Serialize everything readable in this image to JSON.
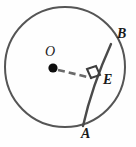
{
  "figure": {
    "background_color": "#fefefe",
    "stroke_color": "#555555",
    "dash_color": "#666666",
    "label_color": "#1a1a1a",
    "circle": {
      "name": "circle-O",
      "center_x": 65,
      "center_y": 67,
      "radius": 60,
      "stroke_width": 2.0
    },
    "center_point": {
      "name": "center-dot",
      "x": 53,
      "y": 68,
      "radius": 4.6
    },
    "chord": {
      "name": "chord-AB",
      "x1": 111,
      "y1": 44,
      "x2": 83,
      "y2": 126,
      "stroke_width": 2.2
    },
    "segment_OE": {
      "name": "segment-OE",
      "x1": 58,
      "y1": 70,
      "x2": 92,
      "y2": 78,
      "stroke_width": 2.4,
      "dash": "6 4"
    },
    "right_angle_marker": {
      "name": "right-angle-marker-E",
      "corner_x": 97,
      "corner_y": 74,
      "size": 11,
      "stroke_width": 2.0
    },
    "labels": [
      {
        "id": "B",
        "text": "B",
        "x": 117,
        "y": 27
      },
      {
        "id": "E",
        "text": "E",
        "x": 103,
        "y": 73
      },
      {
        "id": "A",
        "text": "A",
        "x": 81,
        "y": 127
      },
      {
        "id": "O",
        "text": "O",
        "x": 45,
        "y": 45
      }
    ]
  }
}
